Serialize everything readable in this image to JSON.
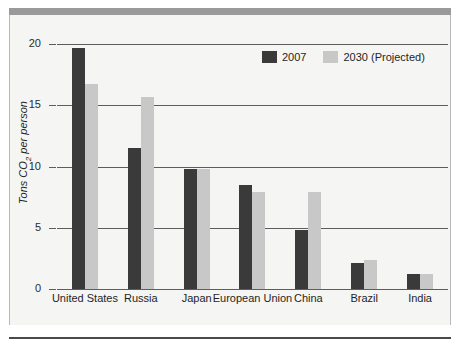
{
  "chart_data": {
    "type": "bar",
    "title": "",
    "subtitle": "",
    "xlabel": "",
    "ylabel": "Tons CO2 per person",
    "ylabel_rich": {
      "prefix": "Tons CO",
      "sub": "2",
      "suffix": " per person"
    },
    "categories": [
      "United States",
      "Russia",
      "Japan",
      "European Union",
      "China",
      "Brazil",
      "India"
    ],
    "series": [
      {
        "name": "2007",
        "color": "#3a3a3a",
        "values": [
          19.7,
          11.5,
          9.8,
          8.5,
          4.8,
          2.1,
          1.2
        ]
      },
      {
        "name": "2030 (Projected)",
        "color": "#c8c8c8",
        "values": [
          16.7,
          15.7,
          9.8,
          7.9,
          7.9,
          2.4,
          1.2
        ]
      }
    ],
    "ylim": [
      0,
      20
    ],
    "yticks": [
      0,
      5,
      10,
      15,
      20
    ],
    "ytick_labels": [
      "0",
      "5",
      "10",
      "15",
      "20"
    ],
    "grid": true,
    "grid_axis": "y",
    "legend_position": "top-right",
    "legend": [
      "2007",
      "2030 (Projected)"
    ]
  },
  "figure": {
    "background": "#f5f5f3",
    "page_background": "#ffffff",
    "top_band_color": "#9a9a9a",
    "bottom_rule_color": "#4a4a4a",
    "axis_color": "#5d5d5d"
  }
}
